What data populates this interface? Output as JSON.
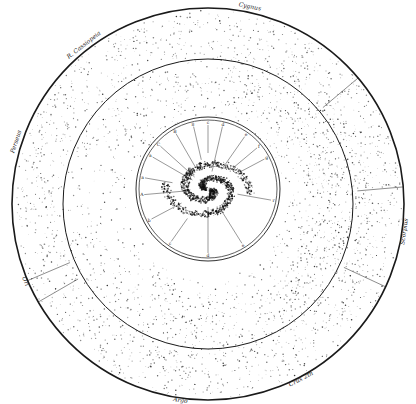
{
  "figure": {
    "colors": {
      "ink": "#1a1a1a",
      "paper": "#ffffff",
      "stars": "#2a2a2a"
    }
  },
  "outer_labels": [
    {
      "id": "cygnus",
      "text": "Cygnus",
      "angle": -78
    },
    {
      "id": "cassiopeia",
      "text": "R. Cassiopeia",
      "angle": -128
    },
    {
      "id": "perseus",
      "text": "Perseus",
      "angle": -162
    },
    {
      "id": "ori",
      "text": "Ori",
      "angle": 157
    },
    {
      "id": "argo",
      "text": "Argo",
      "angle": 98
    },
    {
      "id": "crux",
      "text": "Crux 2th",
      "angle": 62
    },
    {
      "id": "scorpius",
      "text": "Scorpius",
      "angle": 8
    }
  ],
  "inset_labels": [
    {
      "text": "a",
      "angle": -150
    },
    {
      "text": "B",
      "angle": -120
    },
    {
      "text": "8",
      "angle": -103
    },
    {
      "text": "c",
      "angle": -90
    },
    {
      "text": "d",
      "angle": -77
    },
    {
      "text": "e",
      "angle": -55
    },
    {
      "text": "f",
      "angle": -40
    },
    {
      "text": "g",
      "angle": -28
    },
    {
      "text": "C",
      "angle": -138
    },
    {
      "text": "A",
      "angle": 175
    },
    {
      "text": "b",
      "angle": 152
    },
    {
      "text": "c",
      "angle": 125
    },
    {
      "text": "d",
      "angle": 90
    },
    {
      "text": "e",
      "angle": 58
    },
    {
      "text": "r",
      "angle": 10
    },
    {
      "text": "a",
      "angle": -170
    }
  ]
}
